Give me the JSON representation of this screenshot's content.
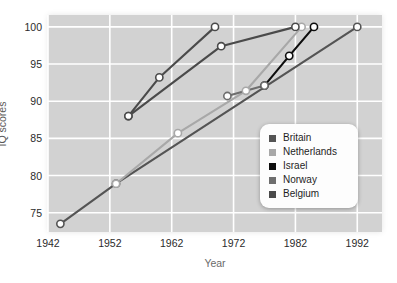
{
  "chart_data": {
    "type": "line",
    "title": "",
    "xlabel": "Year",
    "ylabel": "IQ scores",
    "xlim": [
      1942,
      1996
    ],
    "ylim": [
      72.4,
      101.6
    ],
    "xticks": [
      1942,
      1952,
      1962,
      1972,
      1982,
      1992
    ],
    "yticks": [
      75,
      80,
      85,
      90,
      95,
      100
    ],
    "grid": true,
    "legend_position": "lower-right",
    "marker": "open-circle-white-fill",
    "series": [
      {
        "name": "Britain",
        "color": "#545454",
        "points": [
          {
            "x": 1944,
            "y": 73.5
          },
          {
            "x": 1953,
            "y": 78.9
          },
          {
            "x": 1992,
            "y": 100.0
          }
        ]
      },
      {
        "name": "Netherlands",
        "color": "#a8a8a8",
        "points": [
          {
            "x": 1953,
            "y": 78.9
          },
          {
            "x": 1963,
            "y": 85.7
          },
          {
            "x": 1974,
            "y": 91.4
          },
          {
            "x": 1983,
            "y": 100.0
          }
        ]
      },
      {
        "name": "Israel",
        "color": "#0d0d0d",
        "points": [
          {
            "x": 1977,
            "y": 92.1
          },
          {
            "x": 1981,
            "y": 96.1
          },
          {
            "x": 1985,
            "y": 100.0
          }
        ]
      },
      {
        "name": "Norway",
        "color": "#6e6e6e",
        "points": [
          {
            "x": 1971,
            "y": 90.7
          },
          {
            "x": 1977,
            "y": 92.1
          }
        ]
      },
      {
        "name": "Belgium",
        "color": "#4a4a4a",
        "points": [
          {
            "x": 1955,
            "y": 88.0
          },
          {
            "x": 1960,
            "y": 93.2
          },
          {
            "x": 1969,
            "y": 100.0
          }
        ]
      },
      {
        "name": "Belgium-second",
        "color": "#4a4a4a",
        "points": [
          {
            "x": 1955,
            "y": 88.0
          },
          {
            "x": 1970,
            "y": 97.4
          },
          {
            "x": 1982,
            "y": 100.0
          }
        ]
      }
    ],
    "legend": [
      {
        "label": "Britain",
        "color": "#545454"
      },
      {
        "label": "Netherlands",
        "color": "#a8a8a8"
      },
      {
        "label": "Israel",
        "color": "#0d0d0d"
      },
      {
        "label": "Norway",
        "color": "#6e6e6e"
      },
      {
        "label": "Belgium",
        "color": "#4a4a4a"
      }
    ]
  },
  "axes": {
    "y_tick_labels": [
      "100",
      "95",
      "90",
      "85",
      "80",
      "75"
    ],
    "x_tick_labels": [
      "1942",
      "1952",
      "1962",
      "1972",
      "1982",
      "1992"
    ],
    "y_axis_title": "IQ scores",
    "x_axis_title": "Year"
  },
  "style": {
    "plot_background": "#d2d2d2",
    "gridline_color": "#ffffff",
    "page_background": "#ffffff",
    "legend_background": "#fdfdfd",
    "marker_fill": "#ffffff"
  }
}
